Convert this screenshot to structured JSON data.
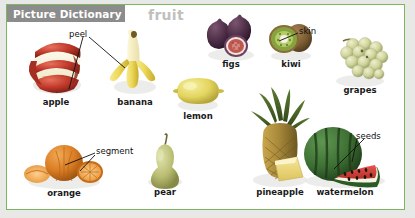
{
  "header": {
    "badge_label": "Picture Dictionary",
    "badge_bg": "#8c8c8c",
    "badge_text_color": "#ffffff",
    "topic_title": "fruit",
    "topic_color": "#bfbfbd"
  },
  "frame": {
    "border_color": "#7bb661",
    "page_bg": "#ffffff",
    "outer_bg": "#e8e8e6"
  },
  "items": [
    {
      "key": "apple",
      "label": "apple",
      "color": "#c0392b"
    },
    {
      "key": "banana",
      "label": "banana",
      "color": "#e8d25a"
    },
    {
      "key": "lemon",
      "label": "lemon",
      "color": "#e3d55f"
    },
    {
      "key": "figs",
      "label": "figs",
      "color": "#5b3a52"
    },
    {
      "key": "kiwi",
      "label": "kiwi",
      "color": "#8b6b3e"
    },
    {
      "key": "grapes",
      "label": "grapes",
      "color": "#cfd39a"
    },
    {
      "key": "orange",
      "label": "orange",
      "color": "#d97b22"
    },
    {
      "key": "pear",
      "label": "pear",
      "color": "#b9bd72"
    },
    {
      "key": "pineapple",
      "label": "pineapple",
      "color": "#a98a3c"
    },
    {
      "key": "watermelon",
      "label": "watermelon",
      "color": "#2f5c2a"
    }
  ],
  "annotations": [
    {
      "key": "peel",
      "label": "peel",
      "targets": [
        "apple",
        "banana"
      ]
    },
    {
      "key": "skin",
      "label": "skin",
      "targets": [
        "kiwi"
      ]
    },
    {
      "key": "segment",
      "label": "segment",
      "targets": [
        "orange"
      ]
    },
    {
      "key": "seeds",
      "label": "seeds",
      "targets": [
        "watermelon"
      ]
    }
  ]
}
